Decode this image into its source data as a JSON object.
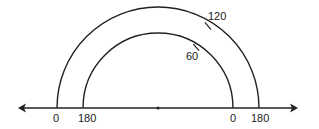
{
  "diagram": {
    "number_line": {
      "y": 108,
      "x_start": 18,
      "x_end": 298,
      "center_point": {
        "x": 158,
        "y": 108
      },
      "arrows": [
        "left",
        "right"
      ]
    },
    "outer_arc": {
      "radius": 101,
      "left_label": "0",
      "right_label": "180",
      "tick": {
        "label": "120",
        "angle_from_left_deg": 120
      }
    },
    "inner_arc": {
      "radius": 75,
      "left_label": "180",
      "right_label": "0",
      "tick": {
        "label": "60",
        "angle_from_right_deg": 60
      }
    },
    "labels": {
      "outer_left": "0",
      "inner_left": "180",
      "inner_right": "0",
      "outer_right": "180",
      "outer_tick": "120",
      "inner_tick": "60"
    },
    "colors": {
      "stroke": "#222222",
      "background": "#ffffff"
    }
  }
}
